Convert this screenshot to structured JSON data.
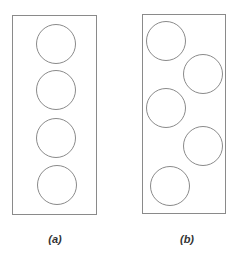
{
  "colors": {
    "stroke": "#8a8a8a",
    "background": "#ffffff",
    "label": "#333333"
  },
  "panels": [
    {
      "id": "a",
      "label": "(a)",
      "arrangement": "aligned column",
      "rect": {
        "x": 12,
        "y": 15,
        "w": 84,
        "h": 199
      },
      "circles": [
        {
          "cx": 56,
          "cy": 44,
          "r": 19.5
        },
        {
          "cx": 56,
          "cy": 90,
          "r": 19.5
        },
        {
          "cx": 56,
          "cy": 138,
          "r": 19.5
        },
        {
          "cx": 57,
          "cy": 185,
          "r": 19.5
        }
      ],
      "label_pos": {
        "x": 55,
        "y": 233
      }
    },
    {
      "id": "b",
      "label": "(b)",
      "arrangement": "staggered zigzag",
      "rect": {
        "x": 142,
        "y": 14,
        "w": 83,
        "h": 199
      },
      "circles": [
        {
          "cx": 166,
          "cy": 41,
          "r": 19.5
        },
        {
          "cx": 203,
          "cy": 74,
          "r": 19.5
        },
        {
          "cx": 166,
          "cy": 108,
          "r": 19.5
        },
        {
          "cx": 203,
          "cy": 146,
          "r": 19.5
        },
        {
          "cx": 170,
          "cy": 186,
          "r": 19.5
        }
      ],
      "label_pos": {
        "x": 187,
        "y": 233
      }
    }
  ]
}
